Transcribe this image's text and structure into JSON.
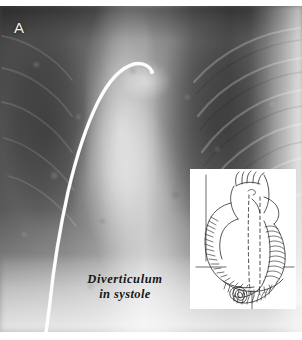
{
  "figure": {
    "panel_label": "A",
    "type": "chest-radiograph-with-inset-line-drawing",
    "caption_line_1": "Diverticulum",
    "caption_line_2": "in systole",
    "colors": {
      "film_dark": "#5d5d5d",
      "film_mid": "#9a9a9a",
      "film_bright": "#d8d8d8",
      "catheter": "#fdfdfd",
      "label_text": "#f2f2f2",
      "caption_text": "#17171a",
      "inset_background": "#ffffff",
      "inset_ink": "#2b2b2b"
    }
  },
  "radiograph": {
    "features": [
      {
        "name": "left-lung-field",
        "tone": "dark"
      },
      {
        "name": "right-lung-field",
        "tone": "dark"
      },
      {
        "name": "mediastinum-spine-column",
        "tone": "bright"
      },
      {
        "name": "aortic-knob",
        "tone": "bright"
      },
      {
        "name": "cardiac-silhouette",
        "tone": "mid"
      },
      {
        "name": "diaphragm-band",
        "tone": "bright"
      },
      {
        "name": "lateral-chest-wall",
        "tone": "bright"
      },
      {
        "name": "catheter",
        "tone": "very-bright"
      },
      {
        "name": "rib-arcs",
        "tone": "faint-bright"
      }
    ]
  },
  "inset_diagram": {
    "title": "cardiac-line-drawing",
    "structures": [
      "aortic-arch",
      "brachiocephalic-branch",
      "left-carotid-branch",
      "left-subclavian-branch",
      "ascending-aorta",
      "right-heart-border",
      "cardiac-apex",
      "descending-aorta",
      "coiled-diverticulum",
      "catheter-path-dashed"
    ],
    "line_style": "ink-hatched",
    "dashed_elements": 2
  }
}
